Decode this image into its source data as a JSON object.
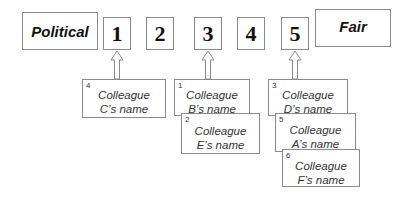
{
  "scale": {
    "left_label": "Political",
    "right_label": "Fair",
    "points": [
      "1",
      "2",
      "3",
      "4",
      "5"
    ]
  },
  "arrows": [
    {
      "points_to": "1"
    },
    {
      "points_to": "3"
    },
    {
      "points_to": "5"
    }
  ],
  "cards": [
    {
      "rank": "4",
      "line1": "Colleague",
      "line2": "C’s name",
      "under": "1"
    },
    {
      "rank": "1",
      "line1": "Colleague",
      "line2": "B’s name",
      "under": "3"
    },
    {
      "rank": "2",
      "line1": "Colleague",
      "line2": "E’s name",
      "under": "3"
    },
    {
      "rank": "3",
      "line1": "Colleague",
      "line2": "D’s name",
      "under": "5"
    },
    {
      "rank": "5",
      "line1": "Colleague",
      "line2": "A’s name",
      "under": "5"
    },
    {
      "rank": "6",
      "line1": "Colleague",
      "line2": "F’s name",
      "under": "5"
    }
  ]
}
